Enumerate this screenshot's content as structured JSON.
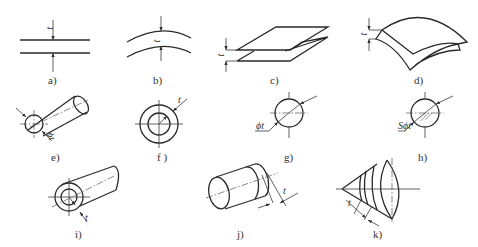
{
  "figure": {
    "panels": [
      {
        "id": "a",
        "label": "a)",
        "description": "two parallel lines, distance t",
        "dimension": "t"
      },
      {
        "id": "b",
        "label": "b)",
        "description": "two parallel curves, distance t",
        "dimension": "t"
      },
      {
        "id": "c",
        "label": "c)",
        "description": "two parallel planes, distance t",
        "dimension": "t"
      },
      {
        "id": "d",
        "label": "d)",
        "description": "two parallel curved surfaces, distance t",
        "dimension": "t"
      },
      {
        "id": "e",
        "label": "e)",
        "description": "cylinder of diameter t",
        "dimension": "ϕt"
      },
      {
        "id": "f",
        "label": "f )",
        "description": "two concentric circles, radial distance t",
        "dimension": "t"
      },
      {
        "id": "g",
        "label": "g)",
        "description": "circle of diameter t",
        "dimension": "ϕt"
      },
      {
        "id": "h",
        "label": "h)",
        "description": "sphere of diameter t",
        "dimension": "Sϕt"
      },
      {
        "id": "i",
        "label": "i)",
        "description": "two coaxial cylinders, radial distance t",
        "dimension": "t"
      },
      {
        "id": "j",
        "label": "j)",
        "description": "two parallel circles on cylinder, axial distance t",
        "dimension": "t"
      },
      {
        "id": "k",
        "label": "k)",
        "description": "two circles on cone surface, distance t",
        "dimension": "t"
      }
    ]
  }
}
